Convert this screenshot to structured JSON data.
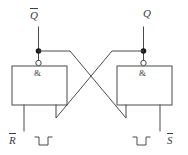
{
  "figure": {
    "name": "rs-nand-latch-schematic",
    "type": "logic-circuit-schematic",
    "style": "IEC rectangular symbols",
    "background_color": "#ffffff",
    "line_color": "#4a4a4a",
    "text_color": "#3d3d3d",
    "dot_color": "#1a1a1a"
  },
  "labels": {
    "q_not": "Q",
    "q_not_overbar": true,
    "q": "Q",
    "q_overbar": false,
    "r_not": "R",
    "r_not_overbar": true,
    "s_not": "S",
    "s_not_overbar": true,
    "gate_left_symbol": "&",
    "gate_right_symbol": "&"
  },
  "gates": [
    {
      "id": "gate-left",
      "symbol": "&",
      "function": "NAND",
      "inverting_output": true,
      "output_label": "Q",
      "output_overbar": true,
      "input_label": "R",
      "input_overbar": true
    },
    {
      "id": "gate-right",
      "symbol": "&",
      "function": "NAND",
      "inverting_output": true,
      "output_label": "Q",
      "output_overbar": false,
      "input_label": "S",
      "input_overbar": true
    }
  ],
  "waveforms": [
    {
      "id": "waveform-r",
      "side": "left",
      "shape": "negative-going pulse",
      "levels": [
        "high",
        "low",
        "high"
      ]
    },
    {
      "id": "waveform-s",
      "side": "right",
      "shape": "negative-going pulse",
      "levels": [
        "high",
        "low",
        "high"
      ]
    }
  ],
  "junctions": [
    {
      "id": "junction-qbar",
      "side": "left"
    },
    {
      "id": "junction-q",
      "side": "right"
    }
  ]
}
